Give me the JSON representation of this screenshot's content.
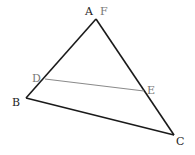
{
  "diagram": {
    "type": "triangle-with-segment",
    "colors": {
      "main_lines": "#1a1a1a",
      "segment_de": "#8a8a8a",
      "label_dark": "#222222",
      "label_light": "#777777"
    },
    "points": {
      "A": {
        "label": "A",
        "x": 96,
        "y": 19
      },
      "F": {
        "label": "F",
        "x": 96,
        "y": 19
      },
      "B": {
        "label": "B",
        "x": 26,
        "y": 98
      },
      "C": {
        "label": "C",
        "x": 174,
        "y": 135
      },
      "D": {
        "label": "D",
        "x": 45,
        "y": 79
      },
      "E": {
        "label": "E",
        "x": 144,
        "y": 91
      }
    },
    "segments": [
      "AB",
      "AC",
      "BC",
      "DE"
    ]
  }
}
